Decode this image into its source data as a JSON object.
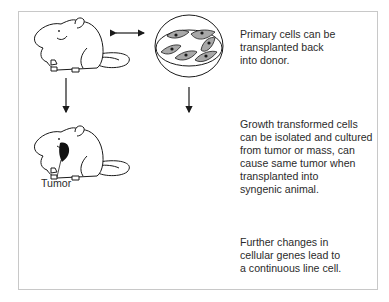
{
  "diagram": {
    "title": "",
    "rows": [
      {
        "id": "primary",
        "animal": "rat",
        "relation": "bidirectional-arrow",
        "dish": "primary-cells-spindle",
        "caption_lines": [
          "Primary cells can be",
          "transplanted back",
          "into donor."
        ]
      },
      {
        "id": "transformed",
        "animal": "rat-with-tumor",
        "animal_label": "Tumor",
        "relation": "bidirectional-arrow",
        "dish": "transformed-cells-clustered",
        "caption_lines": [
          "Growth transformed cells",
          "can be isolated and cultured",
          "from tumor or mass, can",
          "cause same tumor when",
          "transplanted into",
          "syngenic animal."
        ]
      },
      {
        "id": "continuous",
        "animal": "rat",
        "relation": "blocked-bidirectional-arrow",
        "dish": "continuous-line-cells-rounded",
        "caption_lines": [
          "Further changes in",
          "cellular genes lead to",
          "a continuous line cell."
        ]
      }
    ],
    "colors": {
      "frame_border": "#c8c8c8",
      "line": "#1a1a1a",
      "cell_fill": "#a8a8a8",
      "tumor_fill": "#111111",
      "text": "#2b2b2b"
    }
  }
}
